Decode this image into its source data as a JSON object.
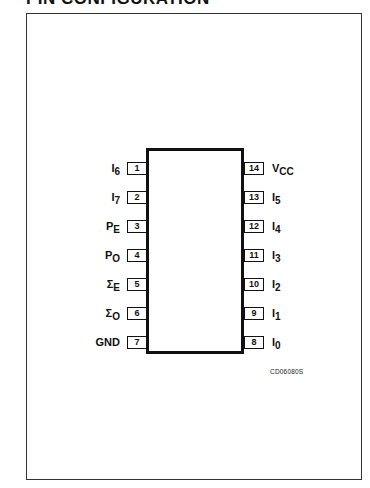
{
  "title": "PIN CONFIGURATION",
  "figure_code": "CD06080S",
  "left_pins": [
    {
      "number": "1",
      "name": "I",
      "sub": "6"
    },
    {
      "number": "2",
      "name": "I",
      "sub": "7"
    },
    {
      "number": "3",
      "name": "P",
      "sub": "E"
    },
    {
      "number": "4",
      "name": "P",
      "sub": "O"
    },
    {
      "number": "5",
      "name": "Σ",
      "sub": "E"
    },
    {
      "number": "6",
      "name": "Σ",
      "sub": "O"
    },
    {
      "number": "7",
      "name": "GND",
      "sub": ""
    }
  ],
  "right_pins": [
    {
      "number": "14",
      "name": "V",
      "sub": "CC"
    },
    {
      "number": "13",
      "name": "I",
      "sub": "5"
    },
    {
      "number": "12",
      "name": "I",
      "sub": "4"
    },
    {
      "number": "11",
      "name": "I",
      "sub": "3"
    },
    {
      "number": "10",
      "name": "I",
      "sub": "2"
    },
    {
      "number": "9",
      "name": "I",
      "sub": "1"
    },
    {
      "number": "8",
      "name": "I",
      "sub": "0"
    }
  ]
}
